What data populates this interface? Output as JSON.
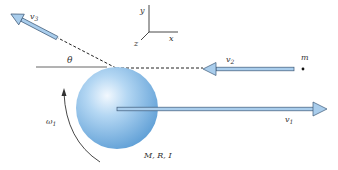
{
  "figure": {
    "axes": {
      "x_label": "x",
      "y_label": "y",
      "z_label": "z"
    },
    "angle_label": "θ",
    "particle": {
      "mass_label": "m"
    },
    "velocities": {
      "v1": {
        "base": "v",
        "sub": "1"
      },
      "v2": {
        "base": "v",
        "sub": "2"
      },
      "v3": {
        "base": "v",
        "sub": "3"
      }
    },
    "angular_velocity": {
      "base": "ω",
      "sub": "1"
    },
    "sphere_label": "M, R, I",
    "colors": {
      "sphere_light": "#e6f2fc",
      "sphere_mid": "#9ecbef",
      "sphere_dark": "#5e9fd6",
      "arrow_fill": "#a9cdec",
      "arrow_stroke": "#3d5a78",
      "line": "#333333"
    }
  }
}
